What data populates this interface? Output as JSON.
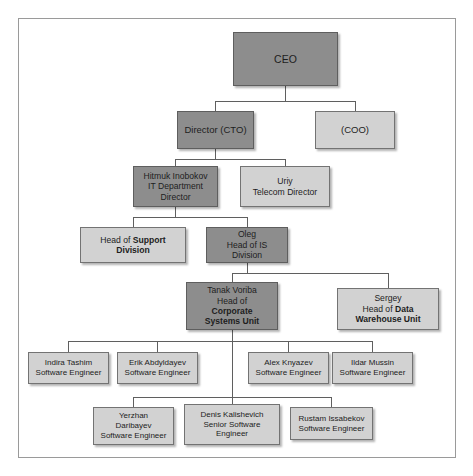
{
  "diagram": {
    "type": "org-chart",
    "frame": {
      "border_color": "#9a9a9a",
      "background": "#ffffff"
    },
    "palette": {
      "dark_node": "#8d8d8d",
      "light_node": "#d2d2d2",
      "node_border": "#6b6b6b",
      "edge_color": "#5f5f5f",
      "text_color": "#1d1d1d"
    },
    "nodes": {
      "ceo": {
        "label": "CEO",
        "style": "dark"
      },
      "cto": {
        "label": "Director (CTO)",
        "style": "dark"
      },
      "coo": {
        "label": "(COO)",
        "style": "light"
      },
      "it_director": {
        "line1": "Hitmuk Inobokov",
        "line2": "IT Department",
        "line3": "Director",
        "style": "dark"
      },
      "telecom_director": {
        "line1": "Uriy",
        "line2": "Telecom Director",
        "style": "light"
      },
      "support_division": {
        "prefix": "Head of ",
        "bold": "Support Division",
        "style": "light"
      },
      "is_division": {
        "line1": "Oleg",
        "line2": "Head of IS",
        "line3": "Division",
        "style": "dark"
      },
      "corporate_systems_unit": {
        "line1": "Tanak Voriba",
        "line2": "Head of",
        "bold1": "Corporate",
        "bold2": "Systems Unit",
        "style": "dark"
      },
      "data_warehouse_unit": {
        "line1": "Sergey",
        "prefix": "Head of ",
        "bold1": "Data",
        "bold2": "Warehouse Unit",
        "style": "light"
      },
      "eng_indira": {
        "name": "Indira Tashim",
        "role": "Software Engineer",
        "style": "light"
      },
      "eng_erik": {
        "name": "Erik Abdyldayev",
        "role": "Software Engineer",
        "style": "light"
      },
      "eng_alex": {
        "name": "Alex Knyazev",
        "role": "Software Engineer",
        "style": "light"
      },
      "eng_ildar": {
        "name": "Ildar Mussin",
        "role": "Software Engineer",
        "style": "light"
      },
      "eng_yerzhan": {
        "name1": "Yerzhan",
        "name2": "Daribayev",
        "role": "Software Engineer",
        "style": "light"
      },
      "eng_denis": {
        "name": "Denis Kalishevich",
        "role1": "Senior Software",
        "role2": "Engineer",
        "style": "light"
      },
      "eng_rustam": {
        "name": "Rustam Issabekov",
        "role": "Software Engineer",
        "style": "light"
      }
    },
    "edges": [
      {
        "from": "ceo",
        "to": "cto"
      },
      {
        "from": "ceo",
        "to": "coo"
      },
      {
        "from": "cto",
        "to": "it_director"
      },
      {
        "from": "cto",
        "to": "telecom_director"
      },
      {
        "from": "it_director",
        "to": "support_division"
      },
      {
        "from": "it_director",
        "to": "is_division"
      },
      {
        "from": "is_division",
        "to": "corporate_systems_unit"
      },
      {
        "from": "is_division",
        "to": "data_warehouse_unit"
      },
      {
        "from": "corporate_systems_unit",
        "to": "eng_indira"
      },
      {
        "from": "corporate_systems_unit",
        "to": "eng_erik"
      },
      {
        "from": "corporate_systems_unit",
        "to": "eng_alex"
      },
      {
        "from": "corporate_systems_unit",
        "to": "eng_ildar"
      },
      {
        "from": "corporate_systems_unit",
        "to": "eng_yerzhan"
      },
      {
        "from": "corporate_systems_unit",
        "to": "eng_denis"
      },
      {
        "from": "corporate_systems_unit",
        "to": "eng_rustam"
      }
    ]
  }
}
